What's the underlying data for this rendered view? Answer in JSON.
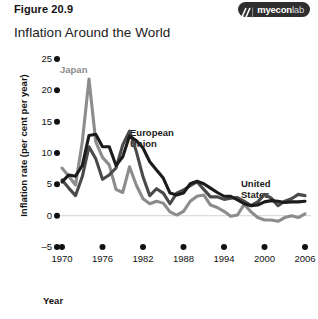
{
  "header": {
    "figure_label": "Figure 20.9",
    "logo_name": "myeconlab",
    "logo_primary": "myecon",
    "logo_secondary": "lab",
    "logo_mark_icon": "slash-mark-icon"
  },
  "chart_data": {
    "type": "line",
    "title": "Inflation Around the World",
    "xlabel": "Year",
    "ylabel": "Inflation rate (per cent per year)",
    "xlim": [
      1970,
      2006
    ],
    "ylim": [
      -5,
      25
    ],
    "yticks": [
      25,
      20,
      15,
      10,
      5,
      0,
      -5
    ],
    "xticks": [
      1970,
      1976,
      1982,
      1988,
      1994,
      2000,
      2006
    ],
    "grid": false,
    "zero_line": true,
    "legend_position": "inline-annotations",
    "x": [
      1970,
      1971,
      1972,
      1973,
      1974,
      1975,
      1976,
      1977,
      1978,
      1979,
      1980,
      1981,
      1982,
      1983,
      1984,
      1985,
      1986,
      1987,
      1988,
      1989,
      1990,
      1991,
      1992,
      1993,
      1994,
      1995,
      1996,
      1997,
      1998,
      1999,
      2000,
      2001,
      2002,
      2003,
      2004,
      2005,
      2006
    ],
    "series": [
      {
        "name": "Japan",
        "color": "#8c8c8c",
        "values": [
          7.6,
          6.3,
          4.9,
          11.7,
          21.8,
          11.8,
          9.3,
          8.1,
          4.2,
          3.7,
          7.8,
          4.9,
          2.7,
          1.9,
          2.3,
          2.0,
          0.6,
          0.1,
          0.7,
          2.3,
          3.1,
          3.3,
          1.7,
          1.3,
          0.7,
          -0.1,
          0.1,
          1.8,
          0.6,
          -0.3,
          -0.7,
          -0.7,
          -0.9,
          -0.3,
          0.0,
          -0.3,
          0.3
        ]
      },
      {
        "name": "European Union",
        "color": "#1c1c1c",
        "values": [
          5.4,
          6.5,
          6.3,
          8.0,
          12.8,
          13.0,
          11.0,
          11.0,
          8.0,
          9.4,
          12.7,
          12.0,
          10.8,
          8.6,
          7.3,
          6.0,
          3.6,
          3.3,
          3.6,
          5.1,
          5.5,
          5.1,
          4.4,
          3.7,
          3.1,
          3.1,
          2.5,
          1.9,
          1.6,
          1.7,
          2.2,
          2.4,
          2.3,
          2.1,
          2.2,
          2.2,
          2.3
        ]
      },
      {
        "name": "United States",
        "color": "#4a4a4a",
        "values": [
          5.7,
          4.4,
          3.2,
          6.2,
          11.0,
          9.1,
          5.8,
          6.5,
          7.6,
          11.3,
          13.5,
          10.3,
          6.2,
          3.2,
          4.3,
          3.6,
          1.9,
          3.6,
          4.1,
          4.8,
          5.4,
          4.2,
          3.0,
          3.0,
          2.6,
          2.8,
          2.9,
          2.3,
          1.6,
          2.2,
          3.4,
          2.8,
          1.6,
          2.3,
          2.7,
          3.4,
          3.2
        ]
      }
    ],
    "annotations": [
      {
        "text": "Japan",
        "series": "Japan"
      },
      {
        "text": "European\nUnion",
        "series": "European Union"
      },
      {
        "text": "United\nStates",
        "series": "United States"
      }
    ]
  },
  "annotation_labels": {
    "japan": "Japan",
    "eu_line1": "European",
    "eu_line2": "Union",
    "us_line1": "United",
    "us_line2": "States"
  }
}
